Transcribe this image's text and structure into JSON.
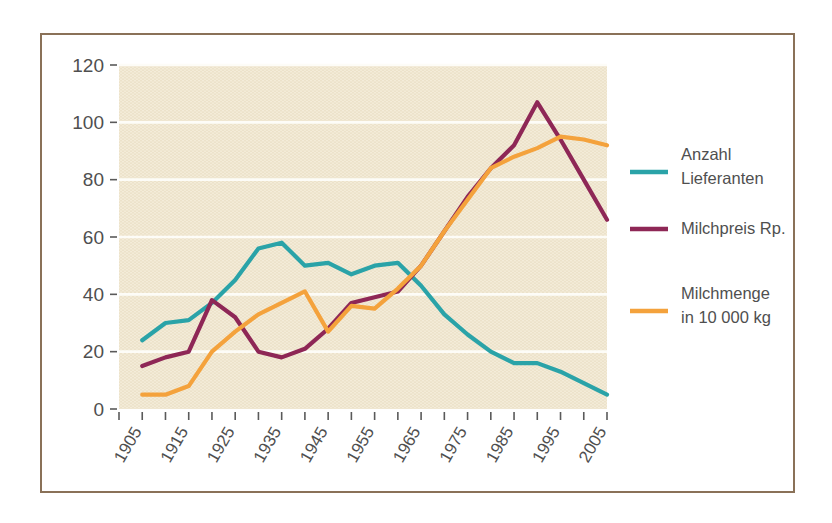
{
  "figure": {
    "frame_color": "#8a7158",
    "plot_background": "#ece2ca",
    "gridline_color": "#fdfcf7"
  },
  "legend": {
    "position": "right",
    "items": [
      {
        "label_line1": "Anzahl",
        "label_line2": "Lieferanten",
        "color": "#2aa3a8",
        "swatch_name": "legend-swatch-anzahl-lieferanten"
      },
      {
        "label_line1": "Milchpreis Rp.",
        "label_line2": "",
        "color": "#8e2756",
        "swatch_name": "legend-swatch-milchpreis"
      },
      {
        "label_line1": "Milchmenge",
        "label_line2": "in 10 000 kg",
        "color": "#f4a23c",
        "swatch_name": "legend-swatch-milchmenge"
      }
    ]
  },
  "chart_data": {
    "type": "line",
    "title": "",
    "subtitle": "",
    "xlabel": "",
    "ylabel": "",
    "xlim": [
      1900,
      2005
    ],
    "ylim": [
      0,
      120
    ],
    "grid": true,
    "legend_position": "right",
    "y_ticks": [
      0,
      20,
      40,
      60,
      80,
      100,
      120
    ],
    "y_tick_labels": [
      "0",
      "20",
      "40",
      "60",
      "80",
      "100",
      "120"
    ],
    "x_tick_labels": [
      "1905",
      "1915",
      "1925",
      "1935",
      "1945",
      "1955",
      "1965",
      "1975",
      "1985",
      "1995",
      "2005"
    ],
    "x_tick_values": [
      1905,
      1915,
      1925,
      1935,
      1945,
      1955,
      1965,
      1975,
      1985,
      1995,
      2005
    ],
    "x_minor_ticks": [
      1900,
      1905,
      1910,
      1915,
      1920,
      1925,
      1930,
      1935,
      1940,
      1945,
      1950,
      1955,
      1960,
      1965,
      1970,
      1975,
      1980,
      1985,
      1990,
      1995,
      2000,
      2005
    ],
    "x": [
      1905,
      1910,
      1915,
      1920,
      1925,
      1930,
      1935,
      1940,
      1945,
      1950,
      1955,
      1960,
      1965,
      1970,
      1975,
      1980,
      1985,
      1990,
      1995,
      2000,
      2005
    ],
    "series": [
      {
        "name": "Anzahl Lieferanten",
        "color": "#2aa3a8",
        "values": [
          24,
          30,
          31,
          37,
          45,
          56,
          58,
          50,
          51,
          47,
          50,
          51,
          43,
          33,
          26,
          20,
          16,
          16,
          13,
          9,
          5
        ]
      },
      {
        "name": "Milchpreis Rp.",
        "color": "#8e2756",
        "values": [
          15,
          18,
          20,
          38,
          32,
          20,
          18,
          21,
          28,
          37,
          39,
          41,
          50,
          62,
          74,
          84,
          92,
          107,
          94,
          80,
          66
        ]
      },
      {
        "name": "Milchmenge in 10 000 kg",
        "color": "#f4a23c",
        "values": [
          5,
          5,
          8,
          20,
          27,
          33,
          37,
          41,
          27,
          36,
          35,
          42,
          50,
          62,
          73,
          84,
          88,
          91,
          95,
          94,
          92
        ]
      }
    ]
  }
}
